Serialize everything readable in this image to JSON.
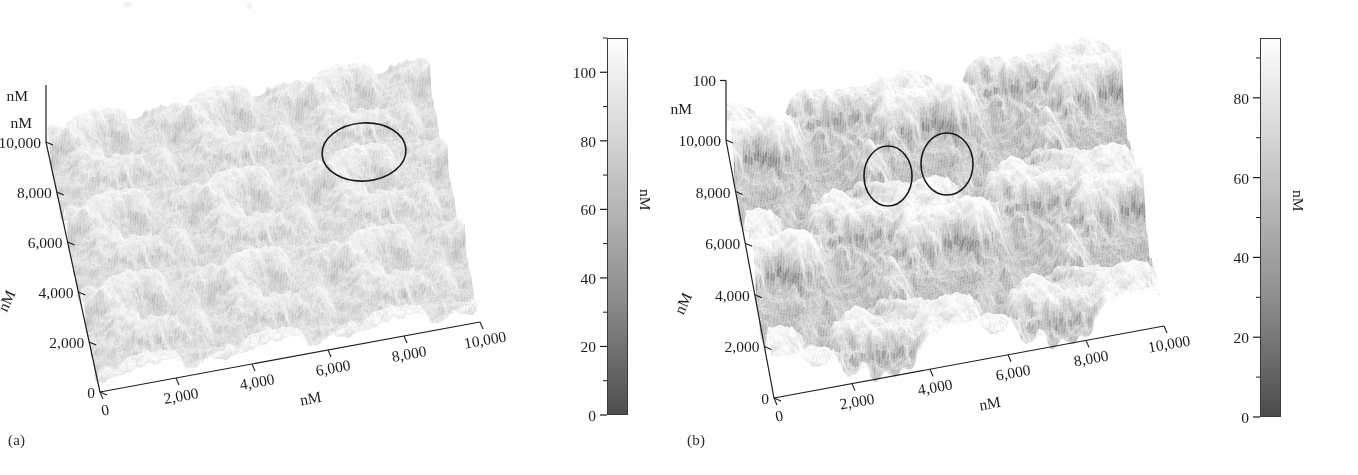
{
  "figure": {
    "kind": "afm-3d-surface-pair",
    "background": "#ffffff",
    "ink": "#1d1d1a"
  },
  "panels": [
    {
      "id": "a",
      "label": "(a)",
      "label_x": 8,
      "label_y": 432,
      "plot": {
        "x": 60,
        "y": 30,
        "w": 520,
        "h": 400
      },
      "surface": {
        "seed": 20241,
        "roughness": 0.52,
        "grain": 3.1,
        "contrast": 0.62,
        "base_light": 0.9,
        "relief": 26,
        "octaves": 5,
        "description": "fine granular low-relief topography, mostly light gray with scattered darker pits"
      },
      "projection": {
        "origin_x": 100,
        "origin_y": 392,
        "x_axis_dx": 380,
        "x_axis_dy": -70,
        "y_axis_dx": -54,
        "y_axis_dy": -250,
        "z_height": 92
      },
      "annotations": [
        {
          "name": "highlight-ellipse-1",
          "cx": 364,
          "cy": 152,
          "rx": 42,
          "ry": 29,
          "rot": -4
        }
      ],
      "z_axis": {
        "show_tick": false,
        "top_label": "",
        "unit": "nM"
      },
      "axes": {
        "x": {
          "title": "nM",
          "ticks": [
            "0",
            "2,000",
            "4,000",
            "6,000",
            "8,000",
            "10,000"
          ],
          "values": [
            0,
            2000,
            4000,
            6000,
            8000,
            10000
          ]
        },
        "y": {
          "title": "nM",
          "unit_top": "nM",
          "ticks": [
            "0",
            "2,000",
            "4,000",
            "6,000",
            "8,000",
            "10,000"
          ],
          "values": [
            0,
            2000,
            4000,
            6000,
            8000,
            10000
          ]
        }
      },
      "colorbar": {
        "unit": "nM",
        "ticks": [
          "0",
          "20",
          "40",
          "60",
          "80",
          "100"
        ],
        "values": [
          0,
          20,
          40,
          60,
          80,
          100
        ],
        "minor_between": true,
        "range_min": 0,
        "range_max": 110,
        "top_color": "#fdfdfd",
        "bottom_color": "#4e4e4e",
        "x": 607,
        "y": 38,
        "w": 21,
        "h": 377
      }
    },
    {
      "id": "b",
      "label": "(b)",
      "label_x": 8,
      "label_y": 432,
      "plot": {
        "x": 55,
        "y": 40,
        "w": 530,
        "h": 395
      },
      "surface": {
        "seed": 77310,
        "roughness": 0.78,
        "grain": 2.2,
        "contrast": 0.95,
        "base_light": 0.86,
        "relief": 42,
        "octaves": 5,
        "description": "coarser high-relief topography with sharper peaks and deeper dark shadowed valleys"
      },
      "projection": {
        "origin_x": 95,
        "origin_y": 398,
        "x_axis_dx": 390,
        "x_axis_dy": -72,
        "y_axis_dx": -48,
        "y_axis_dy": -258,
        "z_height": 96
      },
      "annotations": [
        {
          "name": "highlight-ellipse-1",
          "cx": 209,
          "cy": 176,
          "rx": 24,
          "ry": 30,
          "rot": 0
        },
        {
          "name": "highlight-ellipse-2",
          "cx": 268,
          "cy": 164,
          "rx": 26,
          "ry": 31,
          "rot": 0
        }
      ],
      "z_axis": {
        "show_tick": true,
        "top_label": "100",
        "unit": "nM"
      },
      "axes": {
        "x": {
          "title": "nM",
          "ticks": [
            "0",
            "2,000",
            "4,000",
            "6,000",
            "8,000",
            "10,000"
          ],
          "values": [
            0,
            2000,
            4000,
            6000,
            8000,
            10000
          ]
        },
        "y": {
          "title": "nM",
          "unit_top": "nM",
          "ticks": [
            "0",
            "2,000",
            "4,000",
            "6,000",
            "8,000",
            "10,000"
          ],
          "values": [
            0,
            2000,
            4000,
            6000,
            8000,
            10000
          ]
        }
      },
      "colorbar": {
        "unit": "nM",
        "ticks": [
          "0",
          "20",
          "40",
          "60",
          "80"
        ],
        "values": [
          0,
          20,
          40,
          60,
          80
        ],
        "minor_between": true,
        "range_min": 0,
        "range_max": 95,
        "top_color": "#fdfdfd",
        "bottom_color": "#4a4a4a",
        "x": 581,
        "y": 38,
        "w": 21,
        "h": 379
      }
    }
  ],
  "chart_data": {
    "type": "heatmap",
    "title": "",
    "subtitle": "",
    "plots": [
      {
        "name": "(a)",
        "render": "3d surface (AFM topography)",
        "xlabel": "nM",
        "ylabel": "nM",
        "zlabel": "nM",
        "xlim": [
          0,
          10000
        ],
        "ylim": [
          0,
          10000
        ],
        "zlim": [
          0,
          110
        ],
        "xticks": [
          0,
          2000,
          4000,
          6000,
          8000,
          10000
        ],
        "yticks": [
          0,
          2000,
          4000,
          6000,
          8000,
          10000
        ],
        "colorbar_ticks": [
          0,
          20,
          40,
          60,
          80,
          100
        ],
        "colormap": "grayscale (dark low -> white high)",
        "grid": false,
        "legend": "none",
        "annotations": [
          {
            "type": "ellipse",
            "note": "circled surface feature near upper-centre"
          }
        ]
      },
      {
        "name": "(b)",
        "render": "3d surface (AFM topography)",
        "xlabel": "nM",
        "ylabel": "nM",
        "zlabel": "nM",
        "xlim": [
          0,
          10000
        ],
        "ylim": [
          0,
          10000
        ],
        "zlim": [
          0,
          95
        ],
        "xticks": [
          0,
          2000,
          4000,
          6000,
          8000,
          10000
        ],
        "yticks": [
          0,
          2000,
          4000,
          6000,
          8000,
          10000
        ],
        "colorbar_ticks": [
          0,
          20,
          40,
          60,
          80
        ],
        "colormap": "grayscale (dark low -> white high)",
        "grid": false,
        "legend": "none",
        "annotations": [
          {
            "type": "ellipse",
            "note": "circled surface feature, left of pair"
          },
          {
            "type": "ellipse",
            "note": "circled surface feature, right of pair"
          }
        ]
      }
    ]
  }
}
